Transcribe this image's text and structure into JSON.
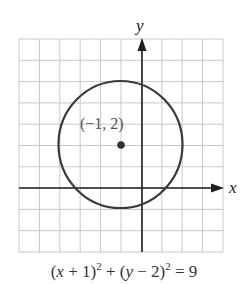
{
  "chart_data": {
    "type": "line",
    "title": "",
    "xlabel": "x",
    "ylabel": "y",
    "xlim": [
      -6,
      4
    ],
    "ylim": [
      -3,
      7
    ],
    "grid": true,
    "grid_step": 1,
    "tick_labels": "none",
    "series": [
      {
        "name": "circle",
        "shape": "circle",
        "center": [
          -1,
          2
        ],
        "radius": 3,
        "equation": "(x + 1)^2 + (y - 2)^2 = 9"
      }
    ],
    "points": [
      {
        "x": -1,
        "y": 2,
        "label": "(−1, 2)"
      }
    ],
    "annotations": [
      "(−1, 2)"
    ]
  },
  "axes": {
    "x_label": "x",
    "y_label": "y"
  },
  "center_point": {
    "label": "(−1, 2)"
  },
  "equation": {
    "lhs_a_open": "(",
    "lhs_a_var": "x",
    "lhs_a_rest": " + 1)",
    "exp_a": "2",
    "plus": " + (",
    "lhs_b_var": "y",
    "lhs_b_rest": " − 2)",
    "exp_b": "2",
    "rhs": " = 9"
  },
  "colors": {
    "grid": "#c8c8c8",
    "axes": "#1e1e1e",
    "circle": "#3a3a3a",
    "point": "#333333"
  }
}
